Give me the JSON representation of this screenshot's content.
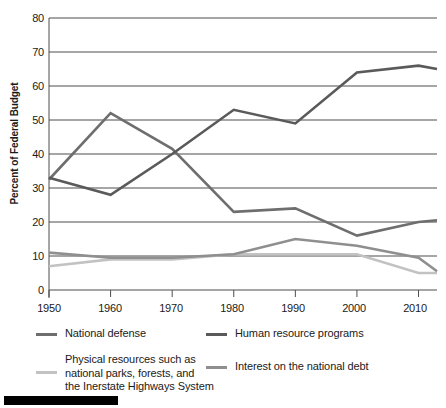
{
  "chart_data": {
    "type": "line",
    "title": "",
    "xlabel": "",
    "ylabel": "Percent of Federal Budget",
    "xlim": [
      1950,
      2013
    ],
    "ylim": [
      0,
      80
    ],
    "yticks": [
      0,
      10,
      20,
      30,
      40,
      50,
      60,
      70,
      80
    ],
    "xticks": [
      1950,
      1960,
      1970,
      1980,
      1990,
      2000,
      2010
    ],
    "grid": "horizontal",
    "legend_position": "bottom",
    "x": [
      1950,
      1960,
      1970,
      1980,
      1990,
      2000,
      2010,
      2013
    ],
    "series": [
      {
        "name": "National defense",
        "color": "#6e6e6e",
        "values": [
          32.5,
          52.0,
          41.5,
          23.0,
          24.0,
          16.0,
          20.0,
          20.5
        ]
      },
      {
        "name": "Human resource programs",
        "color": "#5a5a5a",
        "values": [
          33.0,
          28.0,
          40.0,
          53.0,
          49.0,
          64.0,
          66.0,
          65.0
        ]
      },
      {
        "name": "Physical resources such as\nnational parks, forests, and\nthe Inerstate Highways System",
        "color": "#c2c2c2",
        "values": [
          7.0,
          9.0,
          9.0,
          10.5,
          10.5,
          10.5,
          5.0,
          5.0
        ]
      },
      {
        "name": "Interest on the national debt",
        "color": "#8f8f8f",
        "values": [
          11.0,
          9.5,
          9.5,
          10.5,
          15.0,
          13.0,
          9.5,
          5.5
        ]
      }
    ]
  },
  "axes": {
    "y_title": "Percent of Federal Budget",
    "y_labels": [
      "80",
      "70",
      "60",
      "50",
      "40",
      "30",
      "20",
      "10",
      "0"
    ],
    "x_labels": [
      "1950",
      "1960",
      "1970",
      "1980",
      "1990",
      "2000",
      "2010"
    ]
  },
  "legend": {
    "items": [
      {
        "label": "National defense",
        "color": "#6e6e6e"
      },
      {
        "label": "Human resource programs",
        "color": "#5a5a5a"
      },
      {
        "label": "Physical resources such as\nnational parks, forests, and\nthe Inerstate Highways System",
        "color": "#c2c2c2"
      },
      {
        "label": "Interest on the national debt",
        "color": "#8f8f8f"
      }
    ]
  }
}
